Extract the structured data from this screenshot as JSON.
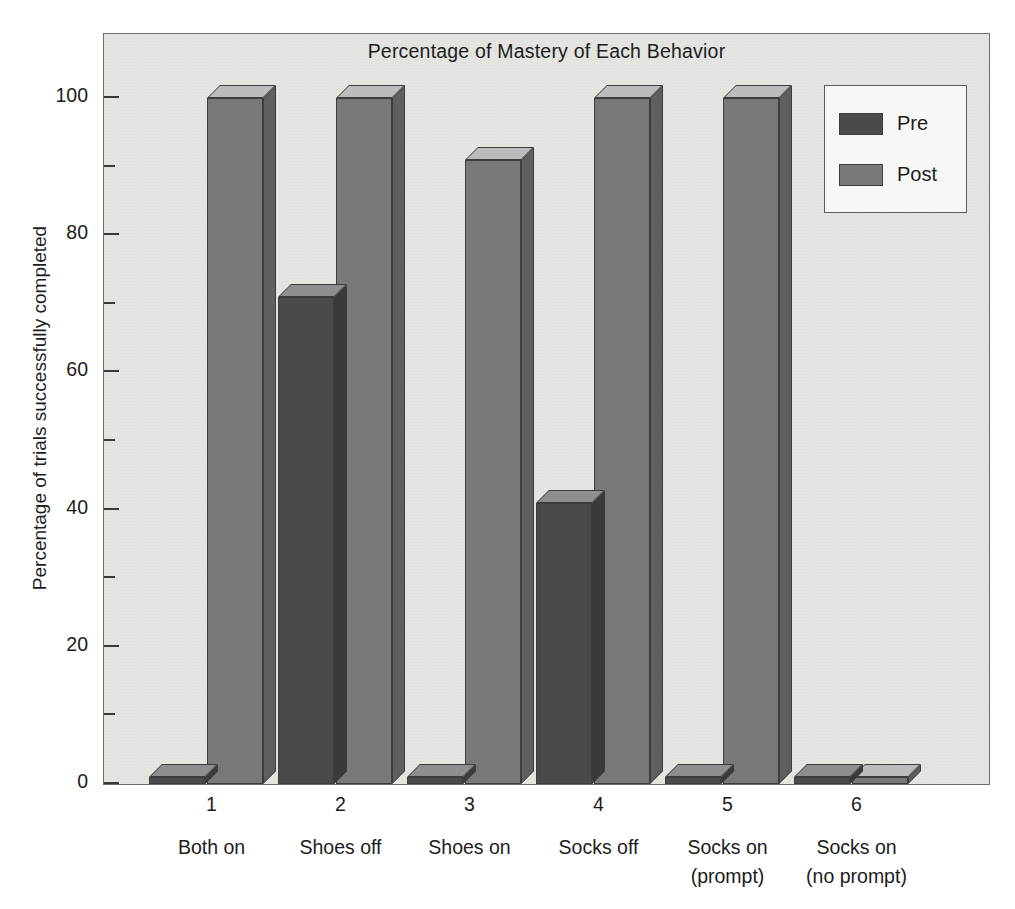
{
  "chart_data": {
    "type": "bar",
    "title": "Percentage of Mastery of Each Behavior",
    "xlabel": "",
    "ylabel": "Percentage of trials successfully completed",
    "ylim": [
      0,
      100
    ],
    "ytick_labels": [
      "0",
      "20",
      "40",
      "60",
      "80",
      "100"
    ],
    "ytick_values": [
      0,
      20,
      40,
      60,
      80,
      100
    ],
    "yminor_tick_values": [
      10,
      30,
      50,
      70,
      90
    ],
    "grid": false,
    "legend_position": "top-right",
    "categories": [
      "Both on",
      "Shoes off",
      "Shoes on",
      "Socks off",
      "Socks on (prompt)",
      "Socks on (no prompt)"
    ],
    "category_numbers": [
      "1",
      "2",
      "3",
      "4",
      "5",
      "6"
    ],
    "category_lines": [
      [
        "Both on"
      ],
      [
        "Shoes off"
      ],
      [
        "Shoes on"
      ],
      [
        "Socks off"
      ],
      [
        "Socks on",
        "(prompt)"
      ],
      [
        "Socks on",
        "(no prompt)"
      ]
    ],
    "series": [
      {
        "name": "Pre",
        "color": "#4a4a4a",
        "values": [
          1,
          71,
          1,
          41,
          1,
          1
        ]
      },
      {
        "name": "Post",
        "color": "#787878",
        "values": [
          100,
          100,
          91,
          100,
          100,
          1
        ]
      }
    ]
  },
  "legend": {
    "entries": [
      {
        "label": "Pre"
      },
      {
        "label": "Post"
      }
    ]
  },
  "colors": {
    "plot_background": "#e4e4e1",
    "figure_background": "#ffffff",
    "axis": "#3a3a3a",
    "pre": "#4a4a4a",
    "post": "#787878"
  }
}
